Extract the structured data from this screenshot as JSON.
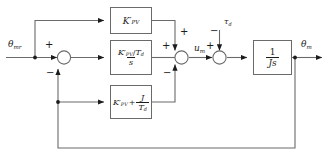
{
  "diagram": {
    "colors": {
      "line": "#6a6a6a",
      "text": "#1c1c1c",
      "background": "#ffffff",
      "block_border": "#6a6a6a"
    },
    "signals": {
      "reference_input": "θ",
      "reference_input_sub": "mr",
      "control_signal": "u",
      "control_signal_sub": "m",
      "disturbance": "τ",
      "disturbance_sub": "d",
      "output": "θ",
      "output_sub": "m"
    },
    "blocks": [
      {
        "id": "proportional-gain",
        "name": "feedforward-proportional-block",
        "expression": "K'_PV",
        "gain_symbol": "K",
        "gain_prime": "′",
        "gain_sub": "PV"
      },
      {
        "id": "integral-term",
        "name": "integral-block",
        "expression": "(K'_PV / T_d) / s",
        "numerator_gain": "K",
        "numerator_prime": "′",
        "numerator_sub": "PV",
        "numerator_divisor": "T",
        "numerator_divisor_sub": "d",
        "denominator": "s",
        "slash": "/"
      },
      {
        "id": "derivative-feedback",
        "name": "feedback-gain-block",
        "expression": "K'_PV + J / T_d",
        "gain_symbol": "K",
        "gain_prime": "′",
        "gain_sub": "PV",
        "plus": "+",
        "frac_num": "J",
        "frac_den": "T",
        "frac_den_sub": "d"
      },
      {
        "id": "plant",
        "name": "plant-block",
        "expression": "1 / (Js)",
        "numerator": "1",
        "denominator": "Js"
      }
    ],
    "summing_junctions": [
      {
        "id": "error-summer",
        "name": "summing-junction-error",
        "signs": {
          "input_left": "+",
          "input_bottom": "−"
        }
      },
      {
        "id": "control-summer",
        "name": "summing-junction-control",
        "signs": {
          "input_left": "+",
          "input_top": "+",
          "input_bottom": "−"
        }
      },
      {
        "id": "disturbance-summer",
        "name": "summing-junction-disturbance",
        "signs": {
          "input_left": "+",
          "input_top": "−"
        }
      }
    ]
  }
}
